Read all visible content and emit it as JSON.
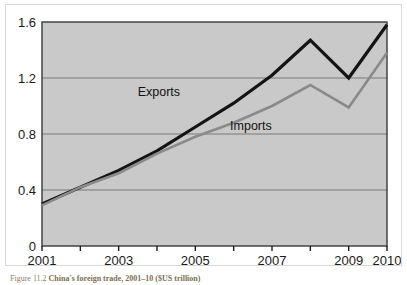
{
  "figure": {
    "caption_number": "Figure 11.2",
    "caption_title": "China's foreign trade, 2001–10 ($US trillion)"
  },
  "chart_data": {
    "type": "line",
    "title": "",
    "xlabel": "",
    "ylabel": "",
    "x": [
      2001,
      2002,
      2003,
      2004,
      2005,
      2006,
      2007,
      2008,
      2009,
      2010
    ],
    "xlim": [
      2001,
      2010
    ],
    "ylim": [
      0,
      1.6
    ],
    "x_tick_values": [
      2001,
      2002,
      2003,
      2004,
      2005,
      2006,
      2007,
      2008,
      2009,
      2010
    ],
    "x_tick_labels": [
      "2001",
      "",
      "2003",
      "",
      "2005",
      "",
      "2007",
      "",
      "2009",
      "2010"
    ],
    "y_ticks": [
      0,
      0.4,
      0.8,
      1.2,
      1.6
    ],
    "y_tick_labels": [
      "0",
      "0.4",
      "0.8",
      "1.2",
      "1.6"
    ],
    "grid": "horizontal",
    "legend_position": "inline-annotations",
    "series": [
      {
        "name": "Exports",
        "color": "#141414",
        "line_width": 3.2,
        "values": [
          0.3,
          0.42,
          0.54,
          0.68,
          0.85,
          1.02,
          1.22,
          1.47,
          1.2,
          1.58
        ],
        "label_x": 2004.05,
        "label_y": 1.07
      },
      {
        "name": "Imports",
        "color": "#8a8a8a",
        "line_width": 2.6,
        "values": [
          0.29,
          0.42,
          0.52,
          0.66,
          0.78,
          0.88,
          1.0,
          1.15,
          0.99,
          1.38
        ],
        "label_x": 2006.45,
        "label_y": 0.83
      }
    ],
    "colors": {
      "plot_background": "#c9c9c9",
      "plot_border": "#3a3a3a",
      "gridline": "#6f6f6f",
      "axis_text": "#1a1a1a",
      "card_background": "#ffffff"
    }
  }
}
